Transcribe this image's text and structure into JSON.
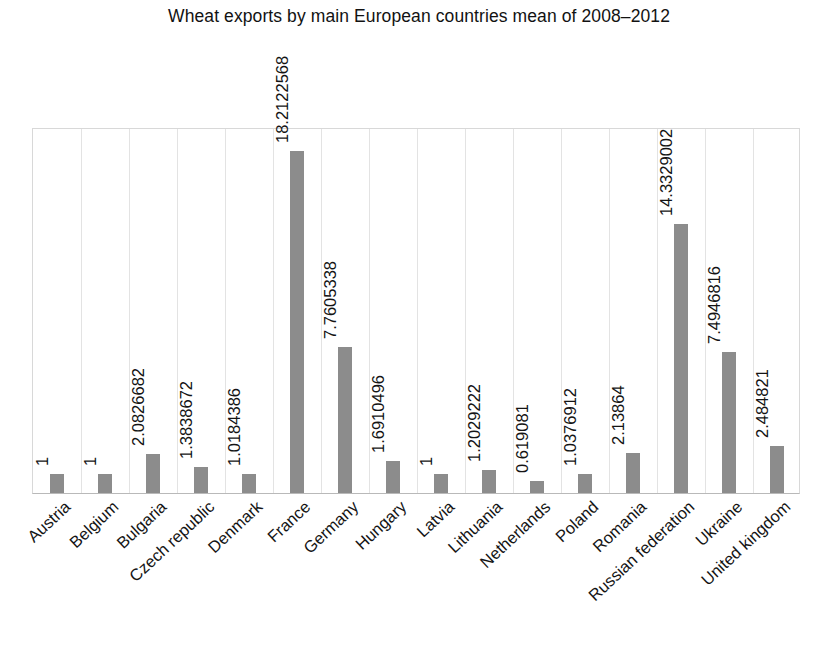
{
  "chart_data": {
    "type": "bar",
    "title": "Wheat exports by main European countries mean of 2008–2012",
    "xlabel": "",
    "ylabel": "",
    "grid": "vertical-category-separators",
    "legend": "none",
    "ylim": [
      0,
      19.5
    ],
    "value_labels_rotated": true,
    "categories": [
      "Austria",
      "Belgium",
      "Bulgaria",
      "Czech republic",
      "Denmark",
      "France",
      "Germany",
      "Hungary",
      "Latvia",
      "Lithuania",
      "Netherlands",
      "Poland",
      "Romania",
      "Russian federation",
      "Ukraine",
      "United kingdom"
    ],
    "values": [
      1,
      1,
      2.0826682,
      1.3838672,
      1.0184386,
      18.2122568,
      7.7605338,
      1.6910496,
      1,
      1.2029222,
      0.619081,
      1.0376912,
      2.13864,
      14.3329002,
      7.4946816,
      2.484821
    ],
    "value_labels": [
      "1",
      "1",
      "2.0826682",
      "1.3838672",
      "1.0184386",
      "18.2122568",
      "7.7605338",
      "1.6910496",
      "1",
      "1.2029222",
      "0.619081",
      "1.0376912",
      "2.13864",
      "14.3329002",
      "7.4946816",
      "2.484821"
    ],
    "bar_color": "#8c8c8c",
    "background_color": "#ffffff",
    "gridline_color": "#e3e3e3",
    "axis_color": "#b9b9b9",
    "text_color": "#141414"
  }
}
